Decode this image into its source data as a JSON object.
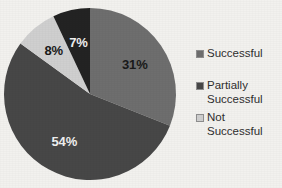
{
  "chart_data": {
    "type": "pie",
    "title": "",
    "categories": [
      "Successful",
      "Partially Successful",
      "Not Successful"
    ],
    "values": [
      31,
      54,
      8
    ],
    "slices": [
      {
        "label": "Successful",
        "value": 31,
        "data_label": "31%",
        "color": "#6e6e6e",
        "label_color": "#1a1a1a"
      },
      {
        "label": "Partially Successful",
        "value": 54,
        "data_label": "54%",
        "color": "#474747",
        "label_color": "#f0f0f0"
      },
      {
        "label": "Not Successful",
        "value": 8,
        "data_label": "8%",
        "color": "#cfcfcf",
        "label_color": "#1a1a1a"
      },
      {
        "label": "",
        "value": 7,
        "data_label": "7%",
        "color": "#232323",
        "label_color": "#f0f0f0"
      }
    ],
    "data_labels": [
      "31%",
      "54%",
      "8%",
      "7%"
    ],
    "legend_position": "right",
    "grid": false,
    "start_angle_deg": 0,
    "direction": "clockwise"
  },
  "legend": {
    "items": [
      {
        "label": "Successful",
        "color": "#6e6e6e"
      },
      {
        "label": "Partially\nSuccessful",
        "color": "#474747"
      },
      {
        "label": "Not Successful",
        "color": "#cfcfcf"
      }
    ]
  },
  "labels": {
    "pct_successful": "31%",
    "pct_partially": "54%",
    "pct_not": "8%",
    "pct_fourth": "7%"
  },
  "colors": {
    "background": "#f2f1ee",
    "successful": "#6e6e6e",
    "partially": "#474747",
    "not_successful": "#cfcfcf",
    "fourth": "#232323"
  }
}
